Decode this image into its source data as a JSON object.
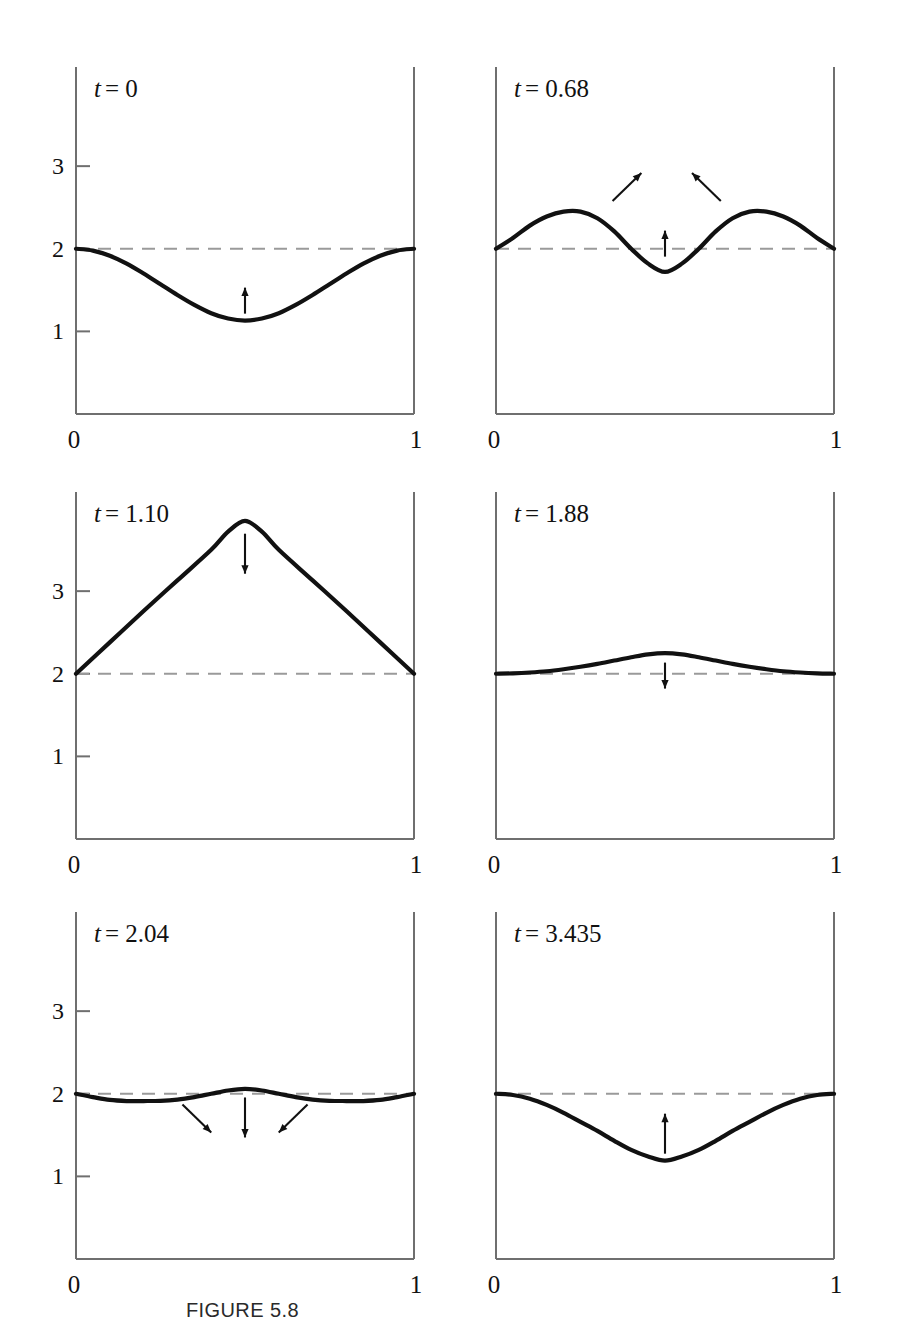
{
  "figure": {
    "caption": "FIGURE 5.8",
    "axis_label_y": "x",
    "xtick_labels": [
      "0",
      "1"
    ],
    "ytick_labels": [
      "1",
      "2",
      "3"
    ],
    "equilibrium_value": 2,
    "line_color": "#111111",
    "dashed_color": "#9a9a9a",
    "axis_color": "#6f6f6f"
  },
  "chart_data": [
    {
      "type": "line",
      "title": "t = 0",
      "xlabel": "",
      "ylabel": "x",
      "xlim": [
        0,
        1
      ],
      "ylim": [
        0,
        4.2
      ],
      "xticks": [
        0,
        1
      ],
      "xticklabels": [
        "0",
        "1"
      ],
      "yticks": [
        1,
        2,
        3
      ],
      "yticklabels": [
        "1",
        "2",
        "3"
      ],
      "grid": false,
      "legend": null,
      "reference_line": {
        "y": 2,
        "style": "dashed"
      },
      "x": [
        0,
        0.05,
        0.1,
        0.15,
        0.2,
        0.25,
        0.3,
        0.35,
        0.4,
        0.45,
        0.5,
        0.55,
        0.6,
        0.65,
        0.7,
        0.75,
        0.8,
        0.85,
        0.9,
        0.95,
        1
      ],
      "values": [
        2.0,
        1.978,
        1.915,
        1.82,
        1.7,
        1.57,
        1.44,
        1.32,
        1.22,
        1.155,
        1.13,
        1.155,
        1.22,
        1.32,
        1.44,
        1.57,
        1.7,
        1.82,
        1.915,
        1.978,
        2.0
      ],
      "annotations": [
        {
          "kind": "arrow",
          "x": 0.5,
          "y": 1.13,
          "direction": "up",
          "length": "short"
        }
      ]
    },
    {
      "type": "line",
      "title": "t = 0.68",
      "xlabel": "",
      "ylabel": "",
      "xlim": [
        0,
        1
      ],
      "ylim": [
        0,
        4.2
      ],
      "xticks": [
        0,
        1
      ],
      "xticklabels": [
        "0",
        "1"
      ],
      "yticks": [],
      "yticklabels": [],
      "grid": false,
      "legend": null,
      "reference_line": {
        "y": 2,
        "style": "dashed"
      },
      "x": [
        0,
        0.05,
        0.1,
        0.15,
        0.2,
        0.25,
        0.3,
        0.35,
        0.4,
        0.45,
        0.5,
        0.55,
        0.6,
        0.65,
        0.7,
        0.75,
        0.8,
        0.85,
        0.9,
        0.95,
        1
      ],
      "values": [
        2.0,
        2.13,
        2.28,
        2.39,
        2.45,
        2.45,
        2.37,
        2.21,
        2.0,
        1.82,
        1.72,
        1.82,
        2.0,
        2.21,
        2.37,
        2.45,
        2.45,
        2.39,
        2.28,
        2.13,
        2.0
      ],
      "annotations": [
        {
          "kind": "arrow",
          "x": 0.33,
          "y": 2.52,
          "direction": "up-right",
          "length": "medium"
        },
        {
          "kind": "arrow",
          "x": 0.5,
          "y": 1.82,
          "direction": "up",
          "length": "short"
        },
        {
          "kind": "arrow",
          "x": 0.68,
          "y": 2.52,
          "direction": "up-left",
          "length": "medium"
        }
      ]
    },
    {
      "type": "line",
      "title": "t = 1.10",
      "xlabel": "",
      "ylabel": "x",
      "xlim": [
        0,
        1
      ],
      "ylim": [
        0,
        4.2
      ],
      "xticks": [
        0,
        1
      ],
      "xticklabels": [
        "0",
        "1"
      ],
      "yticks": [
        1,
        2,
        3
      ],
      "yticklabels": [
        "1",
        "2",
        "3"
      ],
      "grid": false,
      "legend": null,
      "reference_line": {
        "y": 2,
        "style": "dashed"
      },
      "x": [
        0,
        0.1,
        0.2,
        0.3,
        0.4,
        0.45,
        0.5,
        0.55,
        0.6,
        0.7,
        0.8,
        0.9,
        1
      ],
      "values": [
        2.0,
        2.38,
        2.76,
        3.13,
        3.5,
        3.72,
        3.85,
        3.72,
        3.5,
        3.13,
        2.76,
        2.38,
        2.0
      ],
      "annotations": [
        {
          "kind": "arrow",
          "x": 0.5,
          "y": 3.78,
          "direction": "down",
          "length": "medium"
        }
      ]
    },
    {
      "type": "line",
      "title": "t = 1.88",
      "xlabel": "",
      "ylabel": "",
      "xlim": [
        0,
        1
      ],
      "ylim": [
        0,
        4.2
      ],
      "xticks": [
        0,
        1
      ],
      "xticklabels": [
        "0",
        "1"
      ],
      "yticks": [],
      "yticklabels": [],
      "grid": false,
      "legend": null,
      "reference_line": {
        "y": 2,
        "style": "dashed"
      },
      "x": [
        0,
        0.05,
        0.1,
        0.15,
        0.2,
        0.25,
        0.3,
        0.35,
        0.4,
        0.45,
        0.5,
        0.55,
        0.6,
        0.65,
        0.7,
        0.75,
        0.8,
        0.85,
        0.9,
        0.95,
        1
      ],
      "values": [
        2.0,
        2.005,
        2.015,
        2.03,
        2.055,
        2.085,
        2.12,
        2.16,
        2.2,
        2.235,
        2.25,
        2.235,
        2.2,
        2.16,
        2.12,
        2.085,
        2.055,
        2.03,
        2.015,
        2.005,
        2.0
      ],
      "annotations": [
        {
          "kind": "arrow",
          "x": 0.5,
          "y": 2.22,
          "direction": "down",
          "length": "short"
        }
      ]
    },
    {
      "type": "line",
      "title": "t = 2.04",
      "xlabel": "",
      "ylabel": "x",
      "xlim": [
        0,
        1
      ],
      "ylim": [
        0,
        4.2
      ],
      "xticks": [
        0,
        1
      ],
      "xticklabels": [
        "0",
        "1"
      ],
      "yticks": [
        1,
        2,
        3
      ],
      "yticklabels": [
        "1",
        "2",
        "3"
      ],
      "grid": false,
      "legend": null,
      "reference_line": {
        "y": 2,
        "style": "dashed"
      },
      "x": [
        0,
        0.05,
        0.1,
        0.15,
        0.2,
        0.25,
        0.3,
        0.35,
        0.4,
        0.45,
        0.5,
        0.55,
        0.6,
        0.65,
        0.7,
        0.75,
        0.8,
        0.85,
        0.9,
        0.95,
        1
      ],
      "values": [
        2.0,
        1.96,
        1.925,
        1.912,
        1.912,
        1.915,
        1.93,
        1.96,
        2.0,
        2.04,
        2.06,
        2.04,
        2.0,
        1.96,
        1.93,
        1.915,
        1.912,
        1.912,
        1.925,
        1.96,
        2.0
      ],
      "annotations": [
        {
          "kind": "arrow",
          "x": 0.3,
          "y": 1.93,
          "direction": "down-right",
          "length": "medium"
        },
        {
          "kind": "arrow",
          "x": 0.5,
          "y": 2.04,
          "direction": "down",
          "length": "medium"
        },
        {
          "kind": "arrow",
          "x": 0.7,
          "y": 1.93,
          "direction": "down-left",
          "length": "medium"
        }
      ]
    },
    {
      "type": "line",
      "title": "t = 3.435",
      "xlabel": "",
      "ylabel": "",
      "xlim": [
        0,
        1
      ],
      "ylim": [
        0,
        4.2
      ],
      "xticks": [
        0,
        1
      ],
      "xticklabels": [
        "0",
        "1"
      ],
      "yticks": [],
      "yticklabels": [],
      "grid": false,
      "legend": null,
      "reference_line": {
        "y": 2,
        "style": "dashed"
      },
      "x": [
        0,
        0.05,
        0.1,
        0.15,
        0.2,
        0.25,
        0.3,
        0.35,
        0.4,
        0.45,
        0.5,
        0.55,
        0.6,
        0.65,
        0.7,
        0.75,
        0.8,
        0.85,
        0.9,
        0.95,
        1
      ],
      "values": [
        2.0,
        1.985,
        1.94,
        1.865,
        1.77,
        1.66,
        1.55,
        1.43,
        1.32,
        1.24,
        1.19,
        1.24,
        1.32,
        1.43,
        1.55,
        1.66,
        1.77,
        1.865,
        1.94,
        1.985,
        2.0
      ],
      "annotations": [
        {
          "kind": "arrow",
          "x": 0.5,
          "y": 1.19,
          "direction": "up",
          "length": "medium"
        }
      ]
    }
  ],
  "panels_layout": [
    {
      "left": 20,
      "top": 55,
      "w": 430,
      "h": 405,
      "show_y": true
    },
    {
      "left": 440,
      "top": 55,
      "w": 430,
      "h": 405,
      "show_y": false
    },
    {
      "left": 20,
      "top": 480,
      "w": 430,
      "h": 405,
      "show_y": true
    },
    {
      "left": 440,
      "top": 480,
      "w": 430,
      "h": 405,
      "show_y": false
    },
    {
      "left": 20,
      "top": 900,
      "w": 430,
      "h": 405,
      "show_y": true
    },
    {
      "left": 440,
      "top": 900,
      "w": 430,
      "h": 405,
      "show_y": false
    }
  ]
}
